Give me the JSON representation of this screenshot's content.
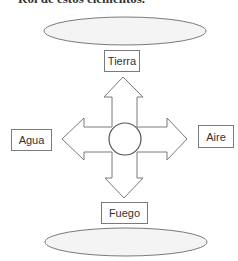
{
  "header": {
    "cut_off_text": "Rol de estos elementos."
  },
  "diagram": {
    "center_label": "",
    "elements": {
      "top": {
        "label": "Tierra"
      },
      "left": {
        "label": "Agua"
      },
      "right": {
        "label": "Aire"
      },
      "bottom": {
        "label": "Fuego"
      }
    },
    "ellipses": {
      "top": {
        "text": ""
      },
      "bottom": {
        "text": ""
      }
    },
    "colors": {
      "stroke": "#7a7a7a",
      "ellipse_fill": "#f4f4f4",
      "background": "#ffffff"
    }
  }
}
